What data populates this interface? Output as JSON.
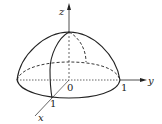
{
  "diagram": {
    "type": "3d-hemisphere",
    "axes": {
      "x": {
        "label": "x",
        "tick": "1"
      },
      "y": {
        "label": "y",
        "tick": "1"
      },
      "z": {
        "label": "z"
      }
    },
    "origin_label": "0",
    "colors": {
      "stroke": "#222222",
      "background": "#ffffff"
    }
  }
}
